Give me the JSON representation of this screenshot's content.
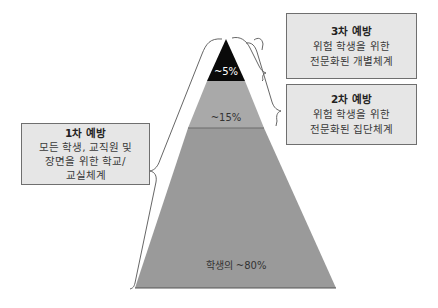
{
  "pyramid": {
    "tiers": [
      {
        "id": "tertiary",
        "label": "~5%",
        "color": "#0a0a0a"
      },
      {
        "id": "secondary",
        "label": "~15%",
        "color": "#a9a9a9"
      },
      {
        "id": "primary",
        "label": "학생의 ~80%",
        "color": "#9a9a9a"
      }
    ]
  },
  "boxes": {
    "tertiary": {
      "title": "3차 예방",
      "lines": [
        "위험 학생을 위한",
        "전문화된 개별체계"
      ]
    },
    "secondary": {
      "title": "2차 예방",
      "lines": [
        "위험 학생을 위한",
        "전문화된 집단체계"
      ]
    },
    "primary": {
      "title": "1차 예방",
      "lines": [
        "모든 학생, 교직원 및",
        "장면을 위한 학교/",
        "교실체계"
      ]
    }
  },
  "colors": {
    "box_fill": "#e6e6e6",
    "box_border": "#6f6f6f",
    "tip": "#0a0a0a",
    "middle": "#a9a9a9",
    "base": "#9a9a9a",
    "brace": "#555555"
  }
}
